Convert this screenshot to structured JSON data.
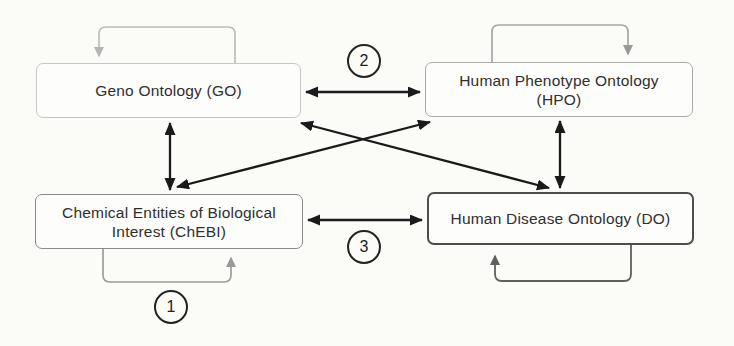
{
  "figure": {
    "type": "ontology-relationship-diagram",
    "background_color": "#fbfbf8",
    "nodes": [
      {
        "id": "go",
        "lines": [
          "Geno Ontology (GO)"
        ]
      },
      {
        "id": "hpo",
        "lines": [
          "Human Phenotype Ontology",
          "(HPO)"
        ]
      },
      {
        "id": "chebi",
        "lines": [
          "Chemical Entities of Biological",
          "Interest (ChEBI)"
        ]
      },
      {
        "id": "do",
        "lines": [
          "Human Disease Ontology (DO)"
        ]
      }
    ],
    "badges": [
      {
        "value": "1",
        "attached_to": "chebi-self-loop"
      },
      {
        "value": "2",
        "attached_to": "go-hpo-edge"
      },
      {
        "value": "3",
        "attached_to": "chebi-do-edge"
      }
    ],
    "edges": [
      {
        "from": "go",
        "to": "hpo",
        "bidirectional": true,
        "badge": "2",
        "style": "black-double-arrow"
      },
      {
        "from": "chebi",
        "to": "do",
        "bidirectional": true,
        "badge": "3",
        "style": "black-double-arrow"
      },
      {
        "from": "go",
        "to": "chebi",
        "bidirectional": true,
        "style": "black-double-arrow"
      },
      {
        "from": "hpo",
        "to": "do",
        "bidirectional": true,
        "style": "black-double-arrow"
      },
      {
        "from": "go",
        "to": "do",
        "bidirectional": true,
        "style": "black-double-arrow"
      },
      {
        "from": "chebi",
        "to": "hpo",
        "bidirectional": true,
        "style": "black-double-arrow"
      }
    ],
    "self_loops": [
      {
        "node": "go",
        "position": "above",
        "color": "#bcbcbc"
      },
      {
        "node": "hpo",
        "position": "above",
        "color": "#a6a6a6"
      },
      {
        "node": "chebi",
        "position": "below",
        "color": "#9c9c9c",
        "badge": "1"
      },
      {
        "node": "do",
        "position": "below",
        "color": "#5f5f5f"
      }
    ],
    "colors": {
      "edge": "#1a1a1a",
      "text": "#2f2f2f",
      "border_light": "#c6c6c6",
      "border_mid": "#8a8a8a",
      "border_dark": "#4d4d4d",
      "badge_border": "#222222"
    }
  }
}
